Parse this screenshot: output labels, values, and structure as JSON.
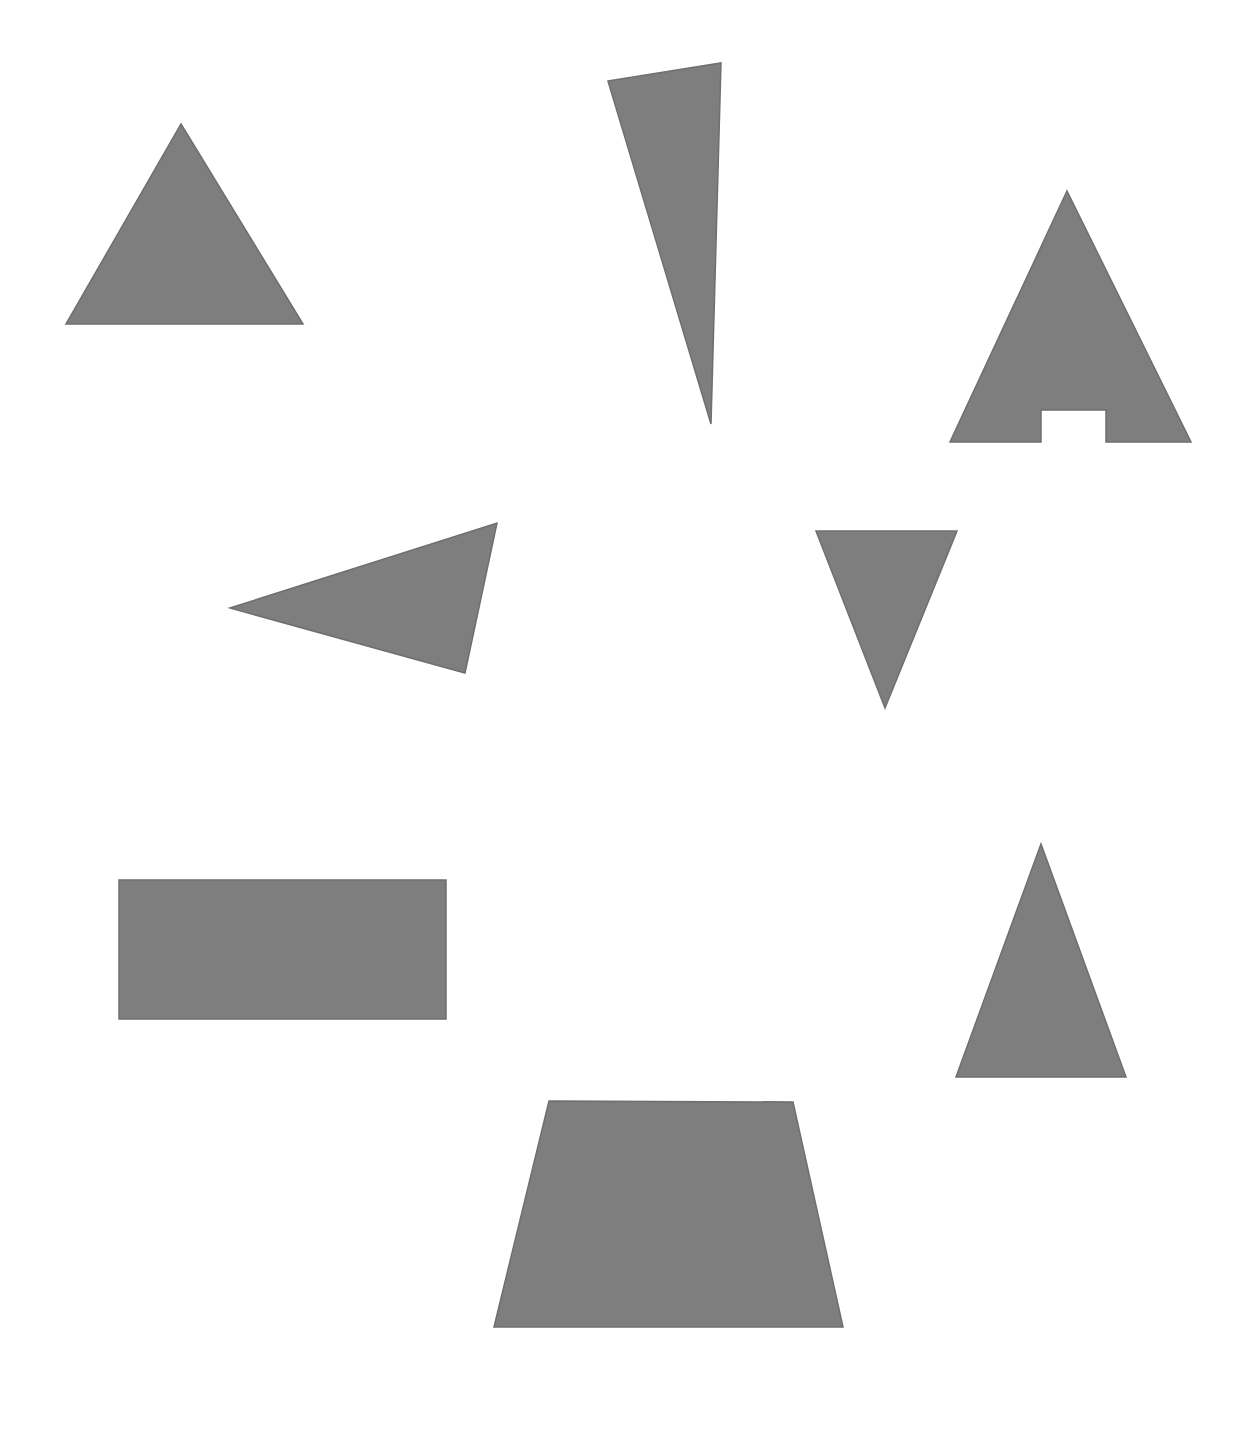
{
  "scene": {
    "title": "Geometric Shapes Scene",
    "width": 1251,
    "height": 1432,
    "background_color": "#ffffff",
    "shape_fill_color": "#7e7e7e",
    "shape_stroke_color": "#6f6f6f",
    "shape_stroke_width": 1.5,
    "shape_count": 8
  },
  "shapes": [
    {
      "id": "shape-1",
      "name": "equilateral-triangle-top-left",
      "label": "Triangle",
      "kind": "triangle",
      "orientation": "pointing-up",
      "points": "181,124 303,324 66,324",
      "bbox": {
        "x": 66,
        "y": 124,
        "width": 237,
        "height": 200
      },
      "centroid": {
        "x": 183,
        "y": 257
      }
    },
    {
      "id": "shape-2",
      "name": "narrow-sliver-triangle-top-center",
      "label": "Narrow triangle",
      "kind": "triangle",
      "orientation": "pointing-down",
      "points": "608,81 721,63 711,424",
      "bbox": {
        "x": 608,
        "y": 63,
        "width": 113,
        "height": 361
      },
      "centroid": {
        "x": 680,
        "y": 189
      }
    },
    {
      "id": "shape-3",
      "name": "notched-triangle-top-right",
      "label": "Triangle with notch",
      "kind": "notched-triangle",
      "orientation": "pointing-up",
      "points": "1067,191 1191,442 1106,442 1106,410 1041,410 1041,442 950,442",
      "bbox": {
        "x": 950,
        "y": 191,
        "width": 241,
        "height": 251
      },
      "notch": {
        "x": 1041,
        "y": 410,
        "width": 65,
        "height": 32
      },
      "centroid": {
        "x": 1068,
        "y": 360
      }
    },
    {
      "id": "shape-4",
      "name": "left-pointing-triangle-middle-left",
      "label": "Triangle",
      "kind": "triangle",
      "orientation": "pointing-left",
      "points": "497,523 465,673 230,608",
      "bbox": {
        "x": 230,
        "y": 523,
        "width": 267,
        "height": 150
      },
      "centroid": {
        "x": 397,
        "y": 601
      }
    },
    {
      "id": "shape-5",
      "name": "down-pointing-triangle-middle-right",
      "label": "Triangle",
      "kind": "triangle",
      "orientation": "pointing-down",
      "points": "816,531 957,531 885,708",
      "bbox": {
        "x": 816,
        "y": 531,
        "width": 141,
        "height": 177
      },
      "centroid": {
        "x": 886,
        "y": 590
      }
    },
    {
      "id": "shape-6",
      "name": "rectangle-lower-left",
      "label": "Rectangle",
      "kind": "rectangle",
      "orientation": "landscape",
      "points": "119,880 446,880 446,1019 119,1019",
      "bbox": {
        "x": 119,
        "y": 880,
        "width": 327,
        "height": 139
      },
      "centroid": {
        "x": 283,
        "y": 950
      }
    },
    {
      "id": "shape-7",
      "name": "tall-triangle-lower-right",
      "label": "Triangle",
      "kind": "triangle",
      "orientation": "pointing-up",
      "points": "1041,844 1126,1077 956,1077",
      "bbox": {
        "x": 956,
        "y": 844,
        "width": 170,
        "height": 233
      },
      "centroid": {
        "x": 1041,
        "y": 999
      }
    },
    {
      "id": "shape-8",
      "name": "trapezoid-bottom-center",
      "label": "Trapezoid",
      "kind": "trapezoid",
      "orientation": "wide-base-bottom",
      "points": "549,1101 793,1102 843,1327 494,1327",
      "bbox": {
        "x": 494,
        "y": 1101,
        "width": 349,
        "height": 226
      },
      "centroid": {
        "x": 669,
        "y": 1222
      }
    }
  ]
}
